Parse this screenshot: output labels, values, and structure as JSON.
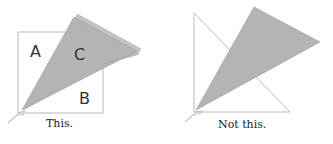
{
  "panels": [
    {
      "caption": "This.",
      "labels": {
        "a": "A",
        "b": "B",
        "c": "C"
      },
      "description": "Gray triangle C overlaps white square; remaining regions A and B"
    },
    {
      "caption": "Not this.",
      "description": "Gray triangle overlapping a white triangle"
    }
  ],
  "colors": {
    "shape_fill_gray": "#b9b9b9",
    "outline": "#9a9a9a",
    "background": "#ffffff"
  }
}
